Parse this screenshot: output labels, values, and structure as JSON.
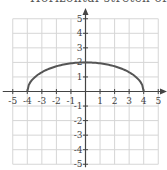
{
  "title_clipped": "Horizontal stretch of y =",
  "chart_data": {
    "type": "line",
    "title": "",
    "xlabel": "",
    "ylabel": "",
    "xlim": [
      -5,
      5
    ],
    "ylim": [
      -5,
      5
    ],
    "grid": true,
    "x_ticks": [
      -5,
      -4,
      -3,
      -2,
      -1,
      1,
      2,
      3,
      4,
      5
    ],
    "y_ticks": [
      -5,
      -4,
      -3,
      -2,
      -1,
      1,
      2,
      3,
      4,
      5
    ],
    "series": [
      {
        "name": "y = 0.5*sqrt(16 - x^2)",
        "color": "#555555",
        "x": [
          -4,
          -3.9,
          -3.5,
          -3,
          -2.5,
          -2,
          -1.5,
          -1,
          -0.5,
          0,
          0.5,
          1,
          1.5,
          2,
          2.5,
          3,
          3.5,
          3.9,
          4
        ],
        "y": [
          0,
          0.44,
          0.97,
          1.32,
          1.56,
          1.73,
          1.85,
          1.94,
          1.98,
          2,
          1.98,
          1.94,
          1.85,
          1.73,
          1.56,
          1.32,
          0.97,
          0.44,
          0
        ]
      }
    ]
  },
  "colors": {
    "grid": "#d6d6d6",
    "axis": "#444444",
    "curve": "#555555"
  }
}
